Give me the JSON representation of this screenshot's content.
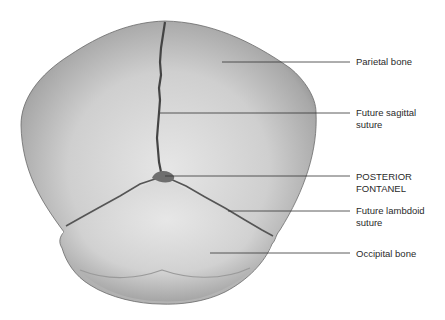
{
  "figure": {
    "labels": [
      {
        "id": "parietal-bone",
        "text": "Parietal bone",
        "y": 56,
        "line_y": 62,
        "line_x1": 222
      },
      {
        "id": "future-sagittal-suture",
        "text": "Future sagittal\nsuture",
        "y": 107,
        "line_y": 113,
        "line_x1": 160
      },
      {
        "id": "posterior-fontanel",
        "text": "POSTERIOR\nFONTANEL",
        "y": 171,
        "line_y": 176,
        "line_x1": 165
      },
      {
        "id": "future-lambdoid-suture",
        "text": "Future lambdoid\nsuture",
        "y": 205,
        "line_y": 211,
        "line_x1": 228
      },
      {
        "id": "occipital-bone",
        "text": "Occipital bone",
        "y": 248,
        "line_y": 253,
        "line_x1": 210
      }
    ],
    "line_x2": 350,
    "colors": {
      "background": "#ffffff",
      "bone_light": "#e4e4e4",
      "bone_mid": "#b8b8b8",
      "bone_dark": "#7a7a7a",
      "suture": "#4a4a4a",
      "leader_line": "#333333",
      "label_text": "#2a2a2a"
    }
  }
}
